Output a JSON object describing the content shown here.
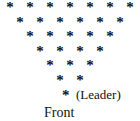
{
  "figure": {
    "background_color": "#ffffff",
    "ink_color": "#111111",
    "marker_glyph": "*",
    "marker_name": "asterisk-marker",
    "rows": [
      {
        "index": 1,
        "count": 7
      },
      {
        "index": 2,
        "count": 6
      },
      {
        "index": 3,
        "count": 5
      },
      {
        "index": 4,
        "count": 4
      },
      {
        "index": 5,
        "count": 3
      },
      {
        "index": 6,
        "count": 2
      },
      {
        "index": 7,
        "count": 1
      }
    ],
    "leader": {
      "glyph": "*",
      "label": "(Leader)"
    },
    "caption": "Front"
  },
  "chart_data": {
    "type": "scatter",
    "title": "",
    "xlabel": "",
    "ylabel": "",
    "categories": [
      "Row 1",
      "Row 2",
      "Row 3",
      "Row 4",
      "Row 5",
      "Row 6",
      "Row 7"
    ],
    "values": [
      7,
      6,
      5,
      4,
      3,
      2,
      1
    ],
    "total_markers": 28,
    "annotations": [
      "(Leader)",
      "Front"
    ],
    "grid": false,
    "legend": false
  }
}
